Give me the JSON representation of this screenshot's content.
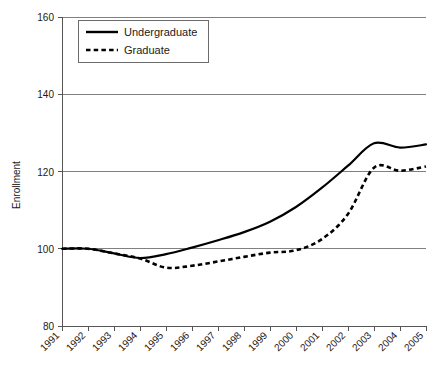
{
  "chart_data": {
    "type": "line",
    "title": "",
    "xlabel": "",
    "ylabel": "Enrollment",
    "x": [
      1991,
      1992,
      1993,
      1994,
      1995,
      1996,
      1997,
      1998,
      1999,
      2000,
      2001,
      2002,
      2003,
      2004,
      2005
    ],
    "categories": [
      "1991",
      "1992",
      "1993",
      "1994",
      "1995",
      "1996",
      "1997",
      "1998",
      "1999",
      "2000",
      "2001",
      "2002",
      "2003",
      "2004",
      "2005"
    ],
    "series": [
      {
        "name": "Undergraduate",
        "style": "solid",
        "values": [
          100.0,
          100.0,
          98.8,
          97.6,
          98.6,
          100.3,
          102.2,
          104.3,
          107.0,
          110.8,
          115.8,
          121.5,
          127.3,
          126.2,
          127.0
        ]
      },
      {
        "name": "Graduate",
        "style": "dashed",
        "values": [
          100.0,
          100.0,
          98.8,
          97.5,
          95.1,
          95.6,
          96.7,
          97.9,
          99.0,
          99.6,
          102.5,
          109.0,
          121.0,
          120.2,
          121.3
        ]
      }
    ],
    "ylim": [
      80,
      160
    ],
    "yticks": [
      80,
      100,
      120,
      140,
      160
    ],
    "ytick_labels": [
      "80",
      "100",
      "120",
      "140",
      "160"
    ],
    "xlim": [
      1991,
      2005
    ],
    "grid": "horizontal",
    "legend_position": "top-left-inside",
    "xtick_label_rotation": 45,
    "colors": {
      "line": "#000000",
      "grid": "#808080",
      "axis": "#555555",
      "background": "#ffffff",
      "text": "#1a1a1a"
    }
  }
}
